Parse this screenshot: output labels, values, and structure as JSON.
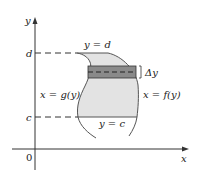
{
  "diagram": {
    "axes": {
      "x_label": "x",
      "y_label": "y",
      "origin_label": "0"
    },
    "levels": {
      "d_label": "d",
      "c_label": "c"
    },
    "boundaries": {
      "top": "y = d",
      "bottom": "y = c",
      "left": "x = g(y)",
      "right": "x = f(y)"
    },
    "strip": {
      "label": "Δy"
    },
    "colors": {
      "region_fill": "#e3e3e3",
      "strip_fill": "#8a8a8a",
      "curve_stroke": "#555555",
      "axis_stroke": "#333333"
    }
  }
}
